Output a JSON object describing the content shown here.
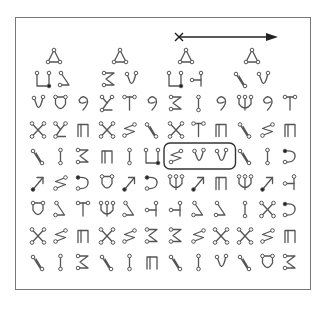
{
  "figure": {
    "arrow": {
      "start_marker": "x",
      "direction": "right"
    },
    "header_row": [
      {
        "top": "triangle",
        "glyphs": [
          "u-square",
          "hook-left"
        ]
      },
      {
        "top": "triangle",
        "glyphs": [
          "three",
          "y-hook"
        ]
      },
      {
        "top": "triangle",
        "glyphs": [
          "u-square",
          "h-bar"
        ]
      },
      {
        "top": "triangle",
        "glyphs": [
          "n-slant",
          "y-hook"
        ]
      }
    ],
    "rows": [
      [
        "y-hook",
        "u-round",
        "nine",
        "z-branch",
        "t-bar",
        "nine",
        "three",
        "i-bar",
        "nine",
        "w-fork",
        "nine",
        "t-bar"
      ],
      [
        "x-cross",
        "z-branch",
        "pi",
        "x-cross",
        "zigzag",
        "n-slant",
        "x-cross",
        "t-bar",
        "pi",
        "n-slant",
        "zigzag",
        "pi"
      ],
      [
        "n-slant",
        "i-bar",
        "three",
        "pi",
        "i-bar",
        "u-square",
        "zigzag",
        "y-hook",
        "y-hook",
        "n-slant",
        "i-bar",
        "c-hook"
      ],
      [
        "arrow-diag",
        "zigzag",
        "c-hook",
        "u-round",
        "arrow-diag",
        "c-hook",
        "w-fork",
        "arrow-diag",
        "pi",
        "w-fork",
        "arrow-diag",
        "h-bar"
      ],
      [
        "u-round",
        "hook-left",
        "t-bar",
        "w-fork",
        "hook-left",
        "h-bar",
        "h-bar",
        "hook-left",
        "hook-left",
        "i-bar",
        "x-cross",
        "c-hook"
      ],
      [
        "x-cross",
        "zigzag",
        "pi",
        "x-cross",
        "zigzag",
        "three",
        "three",
        "zigzag",
        "x-cross",
        "x-cross",
        "zigzag",
        "pi"
      ],
      [
        "n-slant",
        "i-bar",
        "three",
        "n-slant",
        "i-bar",
        "pi",
        "n-slant",
        "i-bar",
        "y-hook",
        "n-slant",
        "u-round",
        "three"
      ]
    ],
    "highlighted": {
      "row": 2,
      "cols": [
        6,
        7,
        8
      ]
    }
  }
}
